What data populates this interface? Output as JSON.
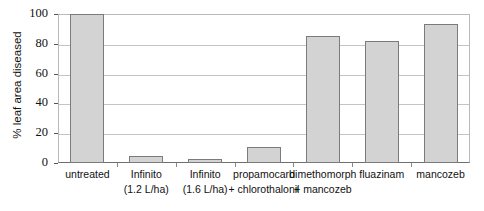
{
  "chart_data": {
    "type": "bar",
    "title": "",
    "xlabel": "",
    "ylabel": "% leaf area diseased",
    "ylim": [
      0,
      100
    ],
    "yticks": [
      0,
      20,
      40,
      60,
      80,
      100
    ],
    "grid": true,
    "legend": "none",
    "orientation": "vertical",
    "bar_fill_color": "#d3d3d3",
    "bar_border_color": "#7b7b7b",
    "categories": [
      "untreated",
      "Infinito (1.2 L/ha)",
      "Infinito (1.6 L/ha)",
      "propamocarb + chlorothalonil",
      "dimethomorph + mancozeb",
      "fluazinam",
      "mancozeb"
    ],
    "values": [
      100,
      5,
      3,
      11,
      85,
      82,
      93
    ],
    "points": [
      {
        "label_line1": "untreated",
        "label_line2": "",
        "value": 100
      },
      {
        "label_line1": "Infinito",
        "label_line2": "(1.2 L/ha)",
        "value": 5
      },
      {
        "label_line1": "Infinito",
        "label_line2": "(1.6 L/ha)",
        "value": 3
      },
      {
        "label_line1": "propamocarb",
        "label_line2": "+ chlorothalonil",
        "value": 11
      },
      {
        "label_line1": "dimethomorph",
        "label_line2": "+ mancozeb",
        "value": 85
      },
      {
        "label_line1": "fluazinam",
        "label_line2": "",
        "value": 82
      },
      {
        "label_line1": "mancozeb",
        "label_line2": "",
        "value": 93
      }
    ]
  }
}
